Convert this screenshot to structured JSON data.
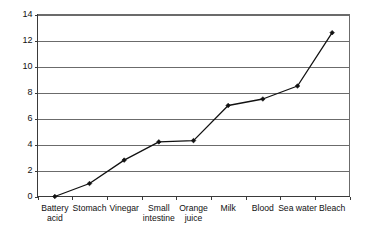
{
  "chart_data": {
    "type": "line",
    "title": "",
    "subtitle": "",
    "xlabel": "",
    "ylabel": "",
    "categories": [
      "Battery acid",
      "Stomach",
      "Vinegar",
      "Small intestine",
      "Orange juice",
      "Milk",
      "Blood",
      "Sea water",
      "Bleach"
    ],
    "category_lines": [
      [
        "Battery",
        "acid"
      ],
      [
        "Stomach"
      ],
      [
        "Vinegar"
      ],
      [
        "Small",
        "intestine"
      ],
      [
        "Orange",
        "juice"
      ],
      [
        "Milk"
      ],
      [
        "Blood"
      ],
      [
        "Sea water"
      ],
      [
        "Bleach"
      ]
    ],
    "values": [
      0,
      1.0,
      2.8,
      4.2,
      4.3,
      7.0,
      7.5,
      8.5,
      12.6
    ],
    "series": [
      {
        "name": "pH",
        "values": [
          0,
          1.0,
          2.8,
          4.2,
          4.3,
          7.0,
          7.5,
          8.5,
          12.6
        ]
      }
    ],
    "ylim": [
      0,
      14
    ],
    "ytick_values": [
      0,
      2,
      4,
      6,
      8,
      10,
      12,
      14
    ],
    "ytick_labels": [
      "0",
      "2",
      "4",
      "6",
      "8",
      "10",
      "12",
      "14"
    ],
    "grid": true,
    "grid_axis": "y",
    "legend": false,
    "legend_position": "none",
    "marker": "diamond",
    "line_color": "#111111",
    "marker_color": "#111111",
    "grid_color": "#6b6b6b",
    "background_color": "#ffffff"
  }
}
